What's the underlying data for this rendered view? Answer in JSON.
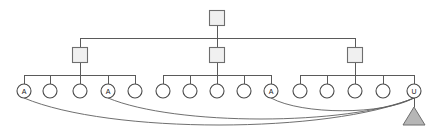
{
  "diagram": {
    "type": "hierarchical-tree",
    "canvas": {
      "width": 436,
      "height": 132,
      "background": "#ffffff"
    },
    "colors": {
      "edge": "#5a5a5a",
      "arc": "#5f5f5f",
      "square_fill": "#f0f0f0",
      "square_stroke": "#6e6e6e",
      "circle_fill": "#ffffff",
      "circle_stroke": "#4a4a4a",
      "triangle_fill": "#b6b6b6",
      "triangle_stroke": "#6e6e6e",
      "label_text": "#1a1a1a"
    },
    "levels": {
      "root_y": 18,
      "bus_top_y": 38,
      "mid_y": 55,
      "bus_mid_y": 75,
      "leaf_y": 91,
      "triangle_y": 116
    },
    "root": {
      "id": "root",
      "shape": "square",
      "label": "",
      "cx": 217,
      "cy": 18,
      "size": 15
    },
    "mid_nodes": [
      {
        "id": "mid-1",
        "shape": "square",
        "label": "",
        "cx": 80,
        "cy": 55,
        "size": 15
      },
      {
        "id": "mid-2",
        "shape": "square",
        "label": "",
        "cx": 217,
        "cy": 55,
        "size": 15
      },
      {
        "id": "mid-3",
        "shape": "square",
        "label": "",
        "cx": 355,
        "cy": 55,
        "size": 15
      }
    ],
    "leaf_nodes": [
      {
        "id": "leaf-1",
        "shape": "circle",
        "label": "A",
        "cx": 24,
        "cy": 91,
        "r": 7,
        "parent": "mid-1"
      },
      {
        "id": "leaf-2",
        "shape": "circle",
        "label": "",
        "cx": 50,
        "cy": 91,
        "r": 7,
        "parent": "mid-1"
      },
      {
        "id": "leaf-3",
        "shape": "circle",
        "label": "",
        "cx": 80,
        "cy": 91,
        "r": 7,
        "parent": "mid-1"
      },
      {
        "id": "leaf-4",
        "shape": "circle",
        "label": "A",
        "cx": 108,
        "cy": 91,
        "r": 7,
        "parent": "mid-1"
      },
      {
        "id": "leaf-5",
        "shape": "circle",
        "label": "",
        "cx": 135,
        "cy": 91,
        "r": 7,
        "parent": "mid-1"
      },
      {
        "id": "leaf-6",
        "shape": "circle",
        "label": "",
        "cx": 163,
        "cy": 91,
        "r": 7,
        "parent": "mid-2"
      },
      {
        "id": "leaf-7",
        "shape": "circle",
        "label": "",
        "cx": 190,
        "cy": 91,
        "r": 7,
        "parent": "mid-2"
      },
      {
        "id": "leaf-8",
        "shape": "circle",
        "label": "",
        "cx": 217,
        "cy": 91,
        "r": 7,
        "parent": "mid-2"
      },
      {
        "id": "leaf-9",
        "shape": "circle",
        "label": "",
        "cx": 244,
        "cy": 91,
        "r": 7,
        "parent": "mid-2"
      },
      {
        "id": "leaf-10",
        "shape": "circle",
        "label": "A",
        "cx": 271,
        "cy": 91,
        "r": 7,
        "parent": "mid-2"
      },
      {
        "id": "leaf-11",
        "shape": "circle",
        "label": "",
        "cx": 300,
        "cy": 91,
        "r": 7,
        "parent": "mid-3"
      },
      {
        "id": "leaf-12",
        "shape": "circle",
        "label": "",
        "cx": 327,
        "cy": 91,
        "r": 7,
        "parent": "mid-3"
      },
      {
        "id": "leaf-13",
        "shape": "circle",
        "label": "",
        "cx": 355,
        "cy": 91,
        "r": 7,
        "parent": "mid-3"
      },
      {
        "id": "leaf-14",
        "shape": "circle",
        "label": "",
        "cx": 383,
        "cy": 91,
        "r": 7,
        "parent": "mid-3"
      },
      {
        "id": "leaf-15",
        "shape": "circle",
        "label": "U",
        "cx": 414,
        "cy": 91,
        "r": 7,
        "parent": "mid-3"
      }
    ],
    "terminal_node": {
      "id": "terminal-triangle",
      "shape": "triangle",
      "label": "",
      "cx": 414,
      "cy": 116,
      "half_width": 11,
      "height": 18
    },
    "arcs": [
      {
        "id": "arc-1",
        "from": "leaf-1",
        "to": "leaf-15",
        "sweep_depth": 36
      },
      {
        "id": "arc-2",
        "from": "leaf-4",
        "to": "leaf-15",
        "sweep_depth": 28
      },
      {
        "id": "arc-3",
        "from": "leaf-10",
        "to": "leaf-15",
        "sweep_depth": 17
      }
    ],
    "group_buses": [
      {
        "id": "bus-top",
        "y": 38,
        "x1": 80,
        "x2": 355
      },
      {
        "id": "bus-mid-1",
        "y": 75,
        "x1": 24,
        "x2": 135
      },
      {
        "id": "bus-mid-2",
        "y": 75,
        "x1": 163,
        "x2": 271
      },
      {
        "id": "bus-mid-3",
        "y": 75,
        "x1": 300,
        "x2": 414
      }
    ]
  }
}
